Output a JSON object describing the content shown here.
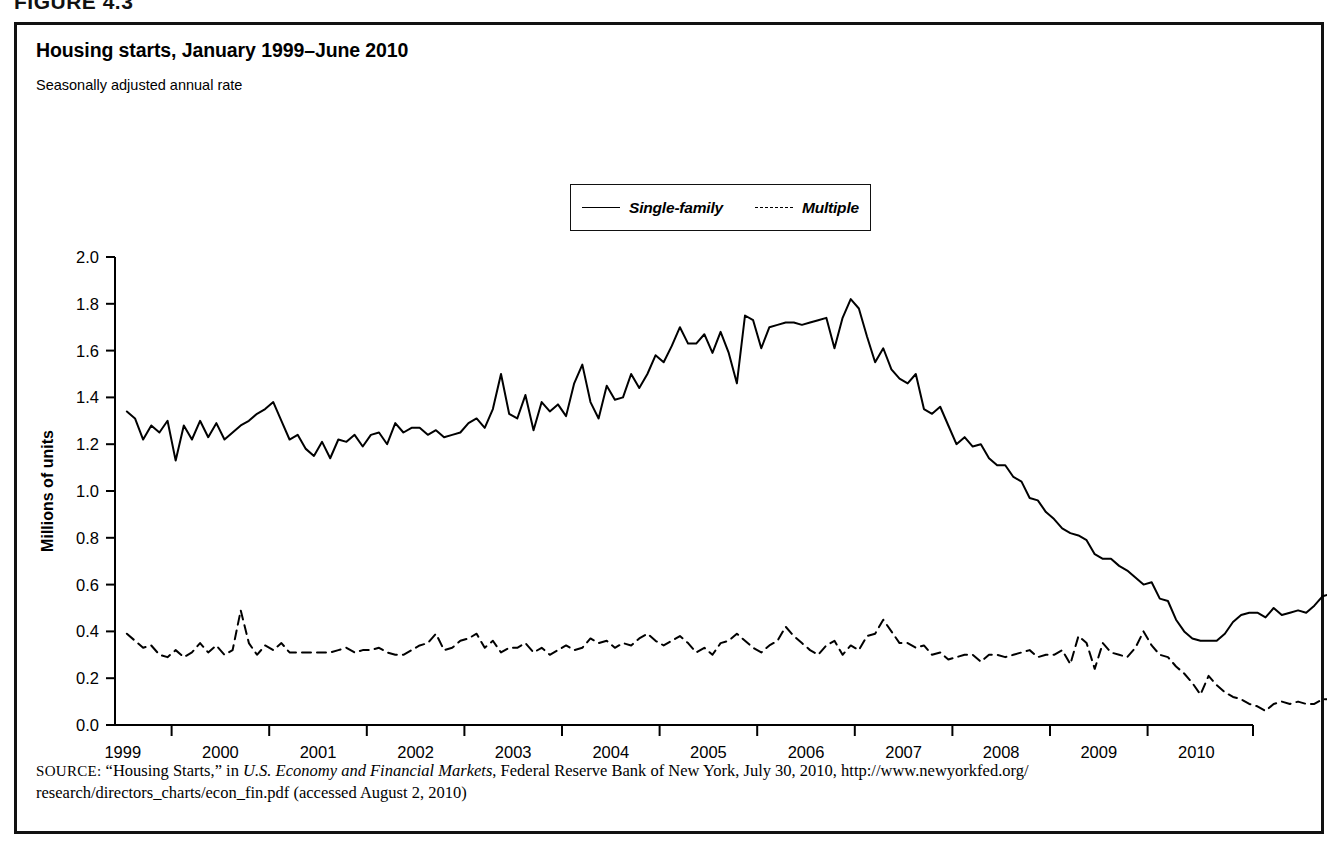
{
  "figure": {
    "label": "FIGURE 4.3"
  },
  "chart_header": {
    "title": "Housing starts, January 1999–June 2010",
    "subtitle": "Seasonally adjusted annual rate"
  },
  "legend": {
    "position": "top-center",
    "entries": [
      {
        "label": "Single-family",
        "style": "solid"
      },
      {
        "label": "Multiple",
        "style": "dashed"
      }
    ]
  },
  "annotations": [
    {
      "name": "june-label",
      "text": "June"
    },
    {
      "name": "single-family-end-value",
      "text": "0.45"
    },
    {
      "name": "multiple-end-value",
      "text": "0.10"
    }
  ],
  "source": {
    "prefix": "SOURCE:",
    "line1_a": " “Housing Starts,” in ",
    "line1_italic": "U.S. Economy and Financial Markets",
    "line1_b": ", Federal Reserve Bank of New York, July 30, 2010, http://www.newyorkfed.org/",
    "line2": "research/directors_charts/econ_fin.pdf (accessed August 2, 2010)"
  },
  "chart_data": {
    "type": "line",
    "title": "Housing starts, January 1999–June 2010",
    "subtitle": "Seasonally adjusted annual rate",
    "xlabel": "",
    "ylabel": "Millions of units",
    "ylim": [
      0.0,
      2.0
    ],
    "ytick_labels": [
      "0.0",
      "0.2",
      "0.4",
      "0.6",
      "0.8",
      "1.0",
      "1.2",
      "1.4",
      "1.6",
      "1.8",
      "2.0"
    ],
    "ytick_values": [
      0.0,
      0.2,
      0.4,
      0.6,
      0.8,
      1.0,
      1.2,
      1.4,
      1.6,
      1.8,
      2.0
    ],
    "xtick_labels": [
      "1999",
      "2000",
      "2001",
      "2002",
      "2003",
      "2004",
      "2005",
      "2006",
      "2007",
      "2008",
      "2009",
      "2010"
    ],
    "xtick_values": [
      1999,
      2000,
      2001,
      2002,
      2003,
      2004,
      2005,
      2006,
      2007,
      2008,
      2009,
      2010
    ],
    "xlim": [
      1998.92,
      2010.58
    ],
    "grid": false,
    "x_start": "1999-01",
    "x_end": "2010-06",
    "x_interval": "monthly",
    "series": [
      {
        "name": "Single-family",
        "style": "solid",
        "color": "#000000",
        "values": [
          1.34,
          1.31,
          1.22,
          1.28,
          1.25,
          1.3,
          1.13,
          1.28,
          1.22,
          1.3,
          1.23,
          1.29,
          1.22,
          1.25,
          1.28,
          1.3,
          1.33,
          1.35,
          1.38,
          1.3,
          1.22,
          1.24,
          1.18,
          1.15,
          1.21,
          1.14,
          1.22,
          1.21,
          1.24,
          1.19,
          1.24,
          1.25,
          1.2,
          1.29,
          1.25,
          1.27,
          1.27,
          1.24,
          1.26,
          1.23,
          1.24,
          1.25,
          1.29,
          1.31,
          1.27,
          1.35,
          1.5,
          1.33,
          1.31,
          1.41,
          1.26,
          1.38,
          1.34,
          1.37,
          1.32,
          1.46,
          1.54,
          1.38,
          1.31,
          1.45,
          1.39,
          1.4,
          1.5,
          1.44,
          1.5,
          1.58,
          1.55,
          1.62,
          1.7,
          1.63,
          1.63,
          1.67,
          1.59,
          1.68,
          1.59,
          1.46,
          1.75,
          1.73,
          1.61,
          1.7,
          1.71,
          1.72,
          1.72,
          1.71,
          1.72,
          1.73,
          1.74,
          1.61,
          1.74,
          1.82,
          1.78,
          1.66,
          1.55,
          1.61,
          1.52,
          1.48,
          1.46,
          1.5,
          1.35,
          1.33,
          1.36,
          1.28,
          1.2,
          1.23,
          1.19,
          1.2,
          1.14,
          1.11,
          1.11,
          1.06,
          1.04,
          0.97,
          0.96,
          0.91,
          0.88,
          0.84,
          0.82,
          0.81,
          0.79,
          0.73,
          0.71,
          0.71,
          0.68,
          0.66,
          0.63,
          0.6,
          0.61,
          0.54,
          0.53,
          0.45,
          0.4,
          0.37,
          0.36,
          0.36,
          0.36,
          0.39,
          0.44,
          0.47,
          0.48,
          0.48,
          0.46,
          0.5,
          0.47,
          0.48,
          0.49,
          0.48,
          0.51,
          0.55,
          0.56,
          0.45
        ]
      },
      {
        "name": "Multiple",
        "style": "dashed",
        "color": "#000000",
        "values": [
          0.39,
          0.36,
          0.33,
          0.34,
          0.3,
          0.29,
          0.32,
          0.29,
          0.31,
          0.35,
          0.31,
          0.34,
          0.3,
          0.32,
          0.49,
          0.35,
          0.3,
          0.34,
          0.32,
          0.35,
          0.31,
          0.31,
          0.31,
          0.31,
          0.31,
          0.31,
          0.32,
          0.33,
          0.31,
          0.32,
          0.32,
          0.33,
          0.31,
          0.3,
          0.3,
          0.32,
          0.34,
          0.35,
          0.39,
          0.32,
          0.33,
          0.36,
          0.37,
          0.39,
          0.33,
          0.36,
          0.31,
          0.33,
          0.33,
          0.35,
          0.31,
          0.33,
          0.3,
          0.32,
          0.34,
          0.32,
          0.33,
          0.37,
          0.35,
          0.36,
          0.33,
          0.35,
          0.34,
          0.37,
          0.39,
          0.36,
          0.34,
          0.36,
          0.38,
          0.35,
          0.31,
          0.33,
          0.3,
          0.35,
          0.36,
          0.39,
          0.36,
          0.33,
          0.31,
          0.34,
          0.36,
          0.42,
          0.38,
          0.35,
          0.32,
          0.3,
          0.34,
          0.36,
          0.3,
          0.34,
          0.32,
          0.38,
          0.39,
          0.45,
          0.4,
          0.35,
          0.35,
          0.33,
          0.34,
          0.3,
          0.31,
          0.28,
          0.29,
          0.3,
          0.3,
          0.27,
          0.3,
          0.3,
          0.29,
          0.3,
          0.31,
          0.32,
          0.29,
          0.3,
          0.3,
          0.32,
          0.26,
          0.38,
          0.35,
          0.24,
          0.35,
          0.31,
          0.3,
          0.29,
          0.33,
          0.4,
          0.34,
          0.3,
          0.29,
          0.25,
          0.22,
          0.18,
          0.13,
          0.21,
          0.17,
          0.14,
          0.12,
          0.11,
          0.09,
          0.08,
          0.06,
          0.09,
          0.1,
          0.09,
          0.1,
          0.09,
          0.09,
          0.11,
          0.11,
          0.1
        ]
      }
    ]
  }
}
